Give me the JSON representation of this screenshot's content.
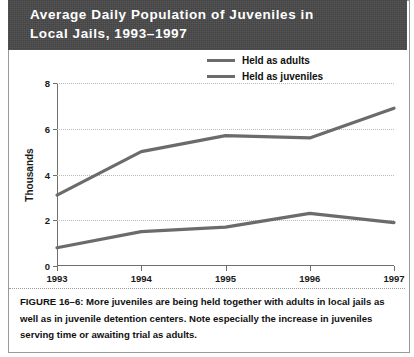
{
  "title": {
    "line1": "Average Daily Population of Juveniles in",
    "line2": "Local Jails, 1993–1997",
    "full": "Average Daily Population of Juveniles in Local Jails, 1993–1997"
  },
  "caption": "FIGURE 16–6: More juveniles are being held together with adults in local jails as well as in juvenile detention centers. Note especially the increase in juveniles serving time or awaiting trial as adults.",
  "colors": {
    "title_band": "#4a4a4a",
    "title_text": "#ffffff",
    "line": "#6b6b6b",
    "grid": "#b9b9b5",
    "axis": "#6f6f6b",
    "text": "#111111",
    "plate": "#ffffff"
  },
  "chart_data": {
    "type": "line",
    "title": "Average Daily Population of Juveniles in Local Jails, 1993–1997",
    "xlabel": "",
    "ylabel": "Thousands",
    "x": [
      "1993",
      "1994",
      "1995",
      "1996",
      "1997"
    ],
    "categories": [
      "1993",
      "1994",
      "1995",
      "1996",
      "1997"
    ],
    "series": [
      {
        "name": "Held as adults",
        "values": [
          3.1,
          5.0,
          5.7,
          5.6,
          6.9
        ]
      },
      {
        "name": "Held as juveniles",
        "values": [
          0.8,
          1.5,
          1.7,
          2.3,
          1.9
        ]
      }
    ],
    "ylim": [
      0,
      8
    ],
    "yticks": [
      0,
      2,
      4,
      6,
      8
    ],
    "ytick_labels": [
      "0",
      "2",
      "4",
      "6",
      "8"
    ],
    "xtick_labels": [
      "1993",
      "1994",
      "1995",
      "1996",
      "1997"
    ],
    "grid": true,
    "grid_style": "dotted-horizontal",
    "legend": [
      "Held as adults",
      "Held as juveniles"
    ],
    "legend_position": "top-right-inside"
  }
}
